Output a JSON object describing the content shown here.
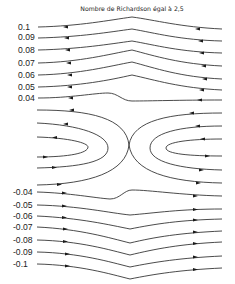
{
  "figure": {
    "title": "Nombre de Richardson égal à 2,5",
    "upper_labels": [
      "0.1",
      "0.09",
      "0.08",
      "0.07",
      "0.06",
      "0.05",
      "0.04"
    ],
    "lower_labels": [
      "-0.04",
      "-0.05",
      "-0.06",
      "-0.07",
      "-0.08",
      "-0.09",
      "-0.1"
    ]
  },
  "colors": {
    "line": "#2a2a2a",
    "background": "#ffffff"
  }
}
